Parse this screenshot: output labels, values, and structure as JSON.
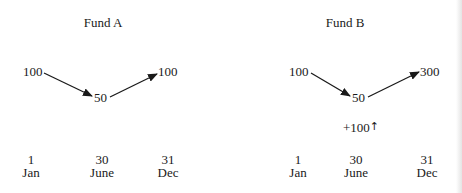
{
  "panels": [
    {
      "title": "Fund A",
      "start_value": "100",
      "mid_value": "50",
      "end_value": "100",
      "cash_flow": "",
      "dates": [
        {
          "day": "1",
          "month": "Jan"
        },
        {
          "day": "30",
          "month": "June"
        },
        {
          "day": "31",
          "month": "Dec"
        }
      ]
    },
    {
      "title": "Fund B",
      "start_value": "100",
      "mid_value": "50",
      "end_value": "300",
      "cash_flow": "+100",
      "cash_flow_icon": "up-arrow-icon",
      "dates": [
        {
          "day": "1",
          "month": "Jan"
        },
        {
          "day": "30",
          "month": "June"
        },
        {
          "day": "31",
          "month": "Dec"
        }
      ]
    }
  ],
  "cash_flow_arrow_glyph": "↑",
  "colors": {
    "text": "#1a1a1a",
    "arrow": "#1a1a1a",
    "background": "#ffffff"
  }
}
